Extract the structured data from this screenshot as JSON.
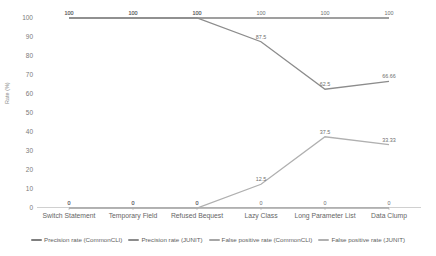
{
  "chart_data": {
    "type": "line",
    "title": "",
    "xlabel": "",
    "ylabel": "Rate (%)",
    "ylim": [
      0,
      100
    ],
    "ytick_labels": [
      "100",
      "90",
      "80",
      "70",
      "60",
      "50",
      "40",
      "30",
      "20",
      "10",
      "0"
    ],
    "ytick_values": [
      100,
      90,
      80,
      70,
      60,
      50,
      40,
      30,
      20,
      10,
      0
    ],
    "grid": false,
    "legend_position": "bottom",
    "categories": [
      "Switch Statement",
      "Temporary Field",
      "Refused Bequest",
      "Lazy Class",
      "Long Parameter List",
      "Data Clump"
    ],
    "series": [
      {
        "name": "Precision rate (CommonCLI)",
        "color": "#7f7f7f",
        "values": [
          100,
          100,
          100,
          100,
          100,
          100
        ],
        "labels": [
          "100",
          "100",
          "100",
          "100",
          "100",
          "100"
        ]
      },
      {
        "name": "Precision rate (JUNIT)",
        "color": "#8c8c8c",
        "values": [
          100,
          100,
          100,
          87.5,
          62.5,
          66.66
        ],
        "labels": [
          "100",
          "100",
          "100",
          "87.5",
          "62.5",
          "66.66"
        ]
      },
      {
        "name": "False positive rate (CommonCLI)",
        "color": "#a6a6a6",
        "values": [
          0,
          0,
          0,
          0,
          0,
          0
        ],
        "labels": [
          "0",
          "0",
          "0",
          "0",
          "0",
          "0"
        ]
      },
      {
        "name": "False positive rate (JUNIT)",
        "color": "#b0b0b0",
        "values": [
          0,
          0,
          0,
          12.5,
          37.5,
          33.33
        ],
        "labels": [
          "0",
          "0",
          "0",
          "12.5",
          "37.5",
          "33.33"
        ]
      }
    ]
  }
}
